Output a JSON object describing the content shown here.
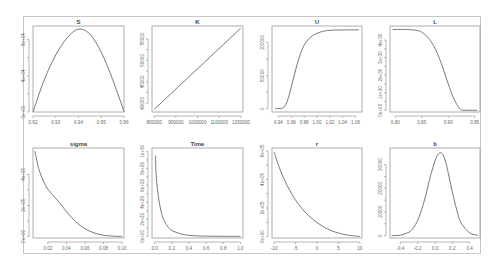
{
  "chart_data": [
    {
      "type": "line",
      "title": "S",
      "xlim": [
        0.92,
        0.96
      ],
      "ylim": [
        0,
        9.5e-07
      ],
      "xticks": [
        0.92,
        0.93,
        0.94,
        0.95,
        0.96
      ],
      "xtick_labels": [
        "0.92",
        "0.93",
        "0.94",
        "0.95",
        "0.96"
      ],
      "yticks": [
        0,
        4e-07,
        8e-07
      ],
      "ytick_labels": [
        "0e+00",
        "4e+04",
        "8e+04"
      ],
      "curve": "parabola",
      "x": [
        0.92,
        0.925,
        0.93,
        0.935,
        0.94,
        0.945,
        0.95,
        0.955,
        0.96
      ],
      "y": [
        2e-09,
        3.6e-07,
        6.3e-07,
        8.2e-07,
        9.15e-07,
        8.6e-07,
        6.6e-07,
        3.6e-07,
        5e-09
      ]
    },
    {
      "type": "line",
      "title": "K",
      "xlim": [
        790000,
        1210000
      ],
      "ylim": [
        38000,
        58000
      ],
      "xticks": [
        800000,
        900000,
        1000000,
        1100000,
        1200000
      ],
      "xtick_labels": [
        "800000",
        "900000",
        "1000000",
        "1100000",
        "1200000"
      ],
      "yticks": [
        40000,
        45000,
        50000,
        55000
      ],
      "ytick_labels": [
        "40000",
        "45000",
        "50000",
        "55000"
      ],
      "x": [
        800000,
        1200000
      ],
      "y": [
        38600,
        57500
      ]
    },
    {
      "type": "line",
      "title": "U",
      "xlim": [
        0.93,
        1.07
      ],
      "ylim": [
        -5000,
        125000
      ],
      "xticks": [
        0.94,
        0.96,
        0.98,
        1.0,
        1.02,
        1.04,
        1.06
      ],
      "xtick_labels": [
        "0.94",
        "0.96",
        "0.98",
        "1.00",
        "1.02",
        "1.04",
        "1.06"
      ],
      "yticks": [
        0,
        50000,
        100000
      ],
      "ytick_labels": [
        "0",
        "50000",
        "100000"
      ],
      "x": [
        0.935,
        0.945,
        0.95,
        0.955,
        0.96,
        0.965,
        0.97,
        0.975,
        0.98,
        0.99,
        1.0,
        1.01,
        1.02,
        1.04,
        1.065
      ],
      "y": [
        0,
        500,
        4000,
        15000,
        33000,
        52000,
        70000,
        85000,
        96000,
        108000,
        114000,
        117000,
        118500,
        119000,
        119200
      ]
    },
    {
      "type": "line",
      "title": "L",
      "xlim": [
        0.79,
        0.96
      ],
      "ylim": [
        -1e+29,
        4.8e+30
      ],
      "xticks": [
        0.8,
        0.85,
        0.9,
        0.95
      ],
      "xtick_labels": [
        "0.80",
        "0.85",
        "0.90",
        "0.95"
      ],
      "yticks": [
        0,
        1e+30,
        2e+30,
        3e+30,
        4e+30
      ],
      "ytick_labels": [
        "0e+00",
        "1e+30",
        "2e+30",
        "3e+30",
        "4e+30"
      ],
      "x": [
        0.795,
        0.82,
        0.84,
        0.85,
        0.86,
        0.87,
        0.88,
        0.89,
        0.9,
        0.91,
        0.92,
        0.925,
        0.93,
        0.955
      ],
      "y": [
        4.6e+30,
        4.6e+30,
        4.55e+30,
        4.45e+30,
        4.2e+30,
        3.8e+30,
        3.2e+30,
        2.4e+30,
        1.5e+30,
        7e+29,
        1.5e+29,
        2e+28,
        0.0,
        0.0
      ]
    },
    {
      "type": "line",
      "title": "sigma",
      "xlim": [
        0.004,
        0.102
      ],
      "ylim": [
        -10000.0,
        570000.0
      ],
      "xticks": [
        0.02,
        0.04,
        0.06,
        0.08,
        0.1
      ],
      "xtick_labels": [
        "0.02",
        "0.04",
        "0.06",
        "0.08",
        "0.10"
      ],
      "yticks": [
        0,
        200000.0,
        400000.0
      ],
      "ytick_labels": [
        "0e+00",
        "2e+05",
        "4e+05"
      ],
      "x": [
        0.006,
        0.01,
        0.015,
        0.02,
        0.025,
        0.03,
        0.035,
        0.04,
        0.05,
        0.06,
        0.07,
        0.08,
        0.09,
        0.1
      ],
      "y": [
        550000.0,
        440000.0,
        360000.0,
        305000.0,
        270000.0,
        235000.0,
        200000.0,
        160000.0,
        95000.0,
        50000.0,
        22000.0,
        8000.0,
        2000.0,
        0.0
      ]
    },
    {
      "type": "line",
      "title": "Time",
      "xlim": [
        -0.03,
        1.03
      ],
      "ylim": [
        -2e+28,
        1.04e+30
      ],
      "xticks": [
        0.0,
        0.2,
        0.4,
        0.6,
        0.8,
        1.0
      ],
      "xtick_labels": [
        "0.0",
        "0.2",
        "0.4",
        "0.6",
        "0.8",
        "1.0"
      ],
      "yticks": [
        0,
        2e+29,
        4e+29,
        6e+29,
        8e+29,
        1e+30
      ],
      "ytick_labels": [
        "0e+00",
        "2e+29",
        "4e+29",
        "6e+29",
        "8e+29",
        "1e+30"
      ],
      "x": [
        0.01,
        0.02,
        0.04,
        0.06,
        0.08,
        0.1,
        0.15,
        0.2,
        0.3,
        0.4,
        0.5,
        0.6,
        0.8,
        1.0
      ],
      "y": [
        9.5e+29,
        7e+29,
        5e+29,
        3.7e+29,
        2.8e+29,
        2.1e+29,
        1.2e+29,
        7e+28,
        3e+28,
        1.2e+28,
        5e+27,
        2e+27,
        0.0,
        0.0
      ]
    },
    {
      "type": "line",
      "title": "r",
      "xlim": [
        -10.5,
        10.5
      ],
      "ylim": [
        -10000.0,
        620000.0
      ],
      "xticks": [
        -10,
        -5,
        0,
        5,
        10
      ],
      "xtick_labels": [
        "-10",
        "-5",
        "0",
        "5",
        "10"
      ],
      "yticks": [
        0,
        200000.0,
        400000.0,
        600000.0
      ],
      "ytick_labels": [
        "0e+00",
        "2e+05",
        "4e+05",
        "6e+05"
      ],
      "x": [
        -10,
        -9,
        -8,
        -7,
        -6,
        -5,
        -4,
        -3,
        -2,
        -1,
        0,
        1,
        2,
        3,
        4,
        6,
        8,
        10
      ],
      "y": [
        590000.0,
        500000.0,
        425000.0,
        360000.0,
        305000.0,
        255000.0,
        215000.0,
        178000.0,
        148000.0,
        122000.0,
        98000.0,
        78000.0,
        60000.0,
        46000.0,
        34000.0,
        17000.0,
        7000.0,
        1000.0
      ]
    },
    {
      "type": "line",
      "title": "b",
      "xlim": [
        -0.52,
        0.52
      ],
      "ylim": [
        -1000,
        37000
      ],
      "xticks": [
        -0.4,
        -0.2,
        0.0,
        0.2,
        0.4
      ],
      "xtick_labels": [
        "-0.4",
        "-0.2",
        "0.0",
        "0.2",
        "0.4"
      ],
      "yticks": [
        0,
        10000,
        20000,
        30000
      ],
      "ytick_labels": [
        "0",
        "10000",
        "20000",
        "30000"
      ],
      "x": [
        -0.5,
        -0.4,
        -0.3,
        -0.25,
        -0.2,
        -0.15,
        -0.1,
        -0.05,
        0.0,
        0.03,
        0.06,
        0.09,
        0.12,
        0.15,
        0.2,
        0.25,
        0.3,
        0.4,
        0.5
      ],
      "y": [
        0,
        200,
        1500,
        3200,
        6500,
        11500,
        18000,
        25500,
        31500,
        34000,
        35000,
        34300,
        31500,
        27000,
        18500,
        11000,
        5500,
        1200,
        100
      ]
    }
  ]
}
